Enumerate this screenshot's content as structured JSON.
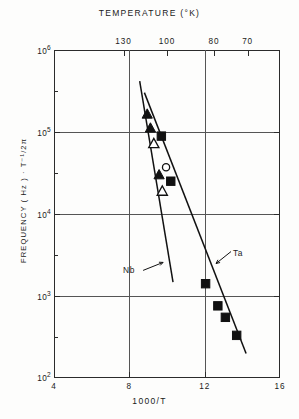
{
  "chart_data": {
    "type": "scatter",
    "title": "TEMPERATURE (°K)",
    "xlabel": "1000/T",
    "ylabel": "FREQUENCY ( Hz ) · T⁻¹/2π",
    "xlim": [
      4,
      16
    ],
    "ylim_log": [
      2,
      6
    ],
    "grid": true,
    "legend": "none",
    "bottom_axis": {
      "label": "1000/T",
      "ticks": [
        4,
        8,
        12,
        16
      ],
      "tick_labels": [
        "4",
        "8",
        "12",
        "16"
      ]
    },
    "top_axis": {
      "label": "TEMPERATURE (°K)",
      "tick_labels": [
        "130",
        "100",
        "80",
        "70"
      ],
      "tick_values_1000_over_T": [
        7.69,
        10.0,
        12.5,
        14.29
      ]
    },
    "y_axis": {
      "label": "FREQUENCY ( Hz ) · T⁻¹/2π",
      "scale": "log",
      "tick_labels": [
        "10^6",
        "10^5",
        "10^4",
        "10^3",
        "10^2"
      ],
      "tick_exponents": [
        6,
        5,
        4,
        3,
        2
      ]
    },
    "annotations": [
      {
        "text": "Nb",
        "x": 9.05,
        "y_log": 3.3
      },
      {
        "text": "Ta",
        "x": 12.55,
        "y_log": 3.42
      }
    ],
    "series": [
      {
        "name": "Nb",
        "marker": "filled-triangle",
        "points": [
          {
            "x": 8.95,
            "y_log": 5.22
          },
          {
            "x": 9.12,
            "y_log": 5.05
          },
          {
            "x": 9.58,
            "y_log": 4.48
          }
        ]
      },
      {
        "name": "Nb-open",
        "marker": "open-triangle",
        "points": [
          {
            "x": 9.3,
            "y_log": 4.86
          },
          {
            "x": 9.75,
            "y_log": 4.28
          }
        ]
      },
      {
        "name": "Ta",
        "marker": "filled-square",
        "points": [
          {
            "x": 9.7,
            "y_log": 4.95
          },
          {
            "x": 10.2,
            "y_log": 4.4
          },
          {
            "x": 12.05,
            "y_log": 3.15
          },
          {
            "x": 12.7,
            "y_log": 2.88
          },
          {
            "x": 13.1,
            "y_log": 2.74
          },
          {
            "x": 13.7,
            "y_log": 2.52
          }
        ]
      },
      {
        "name": "Ta-open",
        "marker": "open-circle",
        "points": [
          {
            "x": 9.95,
            "y_log": 4.57
          }
        ]
      }
    ],
    "fit_lines": [
      {
        "name": "Nb",
        "x0": 8.55,
        "y0_log": 5.62,
        "x1": 10.32,
        "y1_log": 3.17
      },
      {
        "name": "Ta",
        "x0": 8.8,
        "y0_log": 5.48,
        "x1": 14.2,
        "y1_log": 2.3
      }
    ]
  }
}
